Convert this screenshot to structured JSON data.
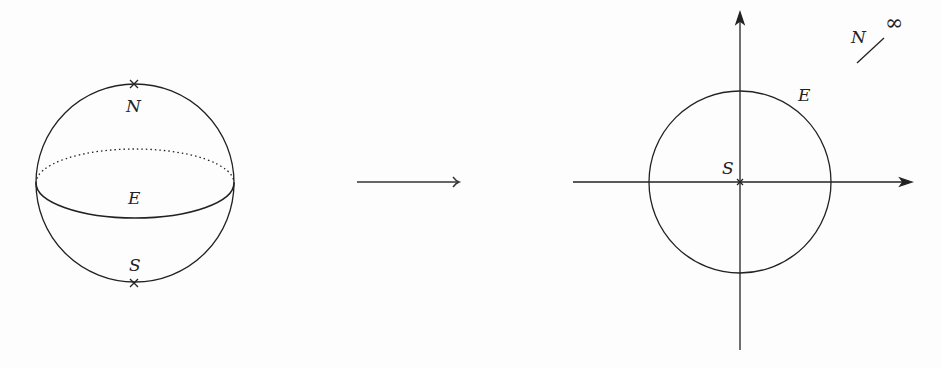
{
  "diagram": {
    "sphere": {
      "north_label": "N",
      "south_label": "S",
      "equator_label": "E"
    },
    "map_arrow": {
      "style": "long-right-arrow"
    },
    "plane": {
      "origin_label": "S",
      "circle_label": "E",
      "infinity_north_label": "N",
      "infinity_symbol": "∞"
    },
    "colors": {
      "stroke": "#222222",
      "background": "#fdfdfd"
    }
  }
}
